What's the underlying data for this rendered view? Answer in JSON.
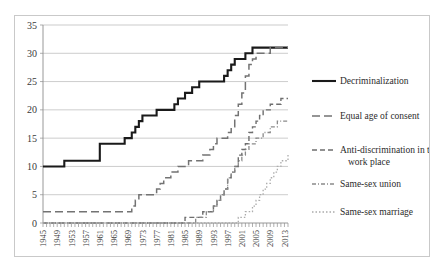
{
  "chart_data": {
    "type": "line",
    "title": "",
    "subtitle": "",
    "xlabel": "",
    "ylabel": "",
    "xlim": [
      1945,
      2014
    ],
    "ylim": [
      0,
      35
    ],
    "ytick_step": 5,
    "yticks": [
      "0",
      "5",
      "10",
      "15",
      "20",
      "25",
      "30",
      "35"
    ],
    "xticks": [
      "1945",
      "1949",
      "1953",
      "1957",
      "1961",
      "1965",
      "1969",
      "1973",
      "1977",
      "1981",
      "1985",
      "1989",
      "1993",
      "1997",
      "2001",
      "2005",
      "2009",
      "2013"
    ],
    "grid": "horizontal",
    "legend_position": "right",
    "x_start": 1945,
    "series": [
      {
        "name": "Decriminalization",
        "style": "solid",
        "color": "#1a1a1a",
        "width": 2.1,
        "dash": "none",
        "values": [
          10,
          10,
          10,
          10,
          10,
          10,
          11,
          11,
          11,
          11,
          11,
          11,
          11,
          11,
          11,
          11,
          14,
          14,
          14,
          14,
          14,
          14,
          14,
          15,
          15,
          16,
          17,
          18,
          19,
          19,
          19,
          19,
          20,
          20,
          20,
          20,
          20,
          21,
          22,
          22,
          23,
          23,
          24,
          24,
          25,
          25,
          25,
          25,
          25,
          25,
          25,
          26,
          27,
          28,
          29,
          29,
          29,
          30,
          30,
          31,
          31,
          31,
          31,
          31,
          31,
          31,
          31,
          31,
          31,
          31
        ]
      },
      {
        "name": "Equal age of consent",
        "style": "long-dash",
        "color": "#737373",
        "width": 1.5,
        "dash": "8,4",
        "values": [
          2,
          2,
          2,
          2,
          2,
          2,
          2,
          2,
          2,
          2,
          2,
          2,
          2,
          2,
          2,
          2,
          2,
          2,
          2,
          2,
          2,
          2,
          2,
          2,
          2,
          3,
          4,
          5,
          5,
          5,
          5,
          5,
          6,
          7,
          8,
          8,
          9,
          9,
          10,
          10,
          10,
          11,
          11,
          11,
          11,
          12,
          12,
          13,
          14,
          15,
          15,
          15,
          16,
          17,
          19,
          21,
          23,
          26,
          28,
          29,
          30,
          30,
          30,
          30,
          31,
          31,
          31,
          31,
          31,
          31
        ]
      },
      {
        "name": "Anti-discrimination in the work place",
        "style": "dash",
        "color": "#6e6e6e",
        "width": 1.4,
        "dash": "5,3",
        "values": [
          0,
          0,
          0,
          0,
          0,
          0,
          0,
          0,
          0,
          0,
          0,
          0,
          0,
          0,
          0,
          0,
          0,
          0,
          0,
          0,
          0,
          0,
          0,
          0,
          0,
          0,
          0,
          0,
          0,
          0,
          0,
          0,
          0,
          0,
          0,
          0,
          0,
          0,
          0,
          0,
          1,
          1,
          1,
          1,
          1,
          2,
          2,
          2,
          3,
          4,
          5,
          6,
          8,
          9,
          10,
          12,
          13,
          14,
          16,
          17,
          18,
          19,
          20,
          20,
          21,
          21,
          21,
          22,
          22,
          22
        ]
      },
      {
        "name": "Same-sex union",
        "style": "dash-dot",
        "color": "#8a8a8a",
        "width": 1.3,
        "dash": "4,2,1,2",
        "values": [
          0,
          0,
          0,
          0,
          0,
          0,
          0,
          0,
          0,
          0,
          0,
          0,
          0,
          0,
          0,
          0,
          0,
          0,
          0,
          0,
          0,
          0,
          0,
          0,
          0,
          0,
          0,
          0,
          0,
          0,
          0,
          0,
          0,
          0,
          0,
          0,
          0,
          0,
          0,
          0,
          0,
          0,
          0,
          1,
          1,
          1,
          2,
          2,
          3,
          4,
          5,
          6,
          8,
          9,
          10,
          11,
          12,
          13,
          14,
          14,
          15,
          15,
          16,
          16,
          17,
          17,
          18,
          18,
          18,
          18
        ]
      },
      {
        "name": "Same-sex marriage",
        "style": "dotted",
        "color": "#ababab",
        "width": 1.3,
        "dash": "1.5,2",
        "values": [
          0,
          0,
          0,
          0,
          0,
          0,
          0,
          0,
          0,
          0,
          0,
          0,
          0,
          0,
          0,
          0,
          0,
          0,
          0,
          0,
          0,
          0,
          0,
          0,
          0,
          0,
          0,
          0,
          0,
          0,
          0,
          0,
          0,
          0,
          0,
          0,
          0,
          0,
          0,
          0,
          0,
          0,
          0,
          0,
          0,
          0,
          0,
          0,
          0,
          0,
          0,
          0,
          0,
          0,
          0,
          1,
          1,
          2,
          2,
          3,
          4,
          5,
          6,
          7,
          8,
          9,
          10,
          11,
          11,
          12
        ]
      }
    ]
  },
  "legend": {
    "entries": [
      {
        "label": "Decriminalization"
      },
      {
        "label": "Equal age of consent"
      },
      {
        "label": "Anti-discrimination in the"
      },
      {
        "label": "work place"
      },
      {
        "label": "Same-sex union"
      },
      {
        "label": "Same-sex marriage"
      }
    ]
  },
  "colors": {
    "grid": "#b6b6b6",
    "axis": "#8c8c8c",
    "frame": "#c9c9c9",
    "text": "#2b2b2b"
  }
}
